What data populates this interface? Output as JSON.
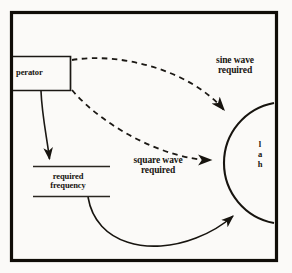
{
  "figure": {
    "type": "data-flow-diagram",
    "background_color": "#fbfaf8",
    "ink_color": "#17140f",
    "frame": {
      "x": 10,
      "y": 11,
      "width": 268,
      "height": 251,
      "stroke_width": 3
    },
    "external_entity": {
      "label": "perator",
      "shape": "rectangle",
      "x": 14,
      "y": 56,
      "width": 56,
      "height": 34,
      "clipped_left": true
    },
    "process_bubble": {
      "label_lines": [
        "l",
        "a",
        "h"
      ],
      "shape": "circle",
      "center_x": 277,
      "center_y": 163,
      "radius": 61,
      "clipped_right": true
    },
    "data_store": {
      "label": "required\nfrequency",
      "label_line_1": "required",
      "label_line_2": "frequency",
      "top_line_y": 166,
      "bottom_line_y": 196,
      "x_start": 33,
      "x_end": 110
    },
    "flows": [
      {
        "name": "sine-wave-flow",
        "label": "sine wave\nrequired",
        "label_line_1": "sine wave",
        "label_line_2": "required",
        "style": "dashed",
        "arrowhead": "filled",
        "from": "external_entity",
        "to": "process_bubble"
      },
      {
        "name": "square-wave-flow",
        "label": "square wave\nrequired",
        "label_line_1": "square wave",
        "label_line_2": "required",
        "style": "dashed",
        "arrowhead": "filled",
        "from": "external_entity",
        "to": "process_bubble"
      },
      {
        "name": "required-frequency-flow",
        "style": "solid",
        "arrowhead": "filled",
        "from": "external_entity",
        "to": "data_store"
      },
      {
        "name": "frequency-to-process-flow",
        "style": "solid",
        "arrowhead": "filled",
        "from": "data_store",
        "to": "process_bubble"
      }
    ]
  }
}
